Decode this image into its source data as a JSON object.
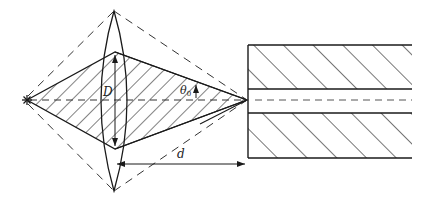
{
  "diagram": {
    "type": "optics-schematic",
    "colors": {
      "stroke": "#1a1a1a",
      "dashed": "#333333",
      "background": "#ffffff"
    },
    "labels": {
      "aperture": "D",
      "angle": "θ",
      "angle_subscript": "0",
      "distance": "d"
    },
    "elements": {
      "source": "point source (star) at left on optical axis",
      "lens": "biconvex lens with aperture D",
      "beam": "hatched cone converging from lens to focal point",
      "outer_cone": "dashed outer boundary rays",
      "axis": "dashed optical axis",
      "channel": "hatched slab pair with central gap (waveguide/fiber entrance)",
      "distance_arrow": "d from lens to channel entrance",
      "half_angle": "θ0 half-angle at focus"
    }
  }
}
